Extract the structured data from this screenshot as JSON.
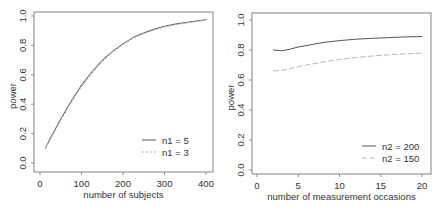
{
  "chart_data": [
    {
      "type": "line",
      "title": "",
      "xlabel": "number of subjects",
      "ylabel": "power",
      "xlim": [
        0,
        400
      ],
      "ylim": [
        0.0,
        1.0
      ],
      "xticks": [
        "0",
        "100",
        "200",
        "300",
        "400"
      ],
      "yticks": [
        "0.0",
        "0.2",
        "0.4",
        "0.6",
        "0.8",
        "1.0"
      ],
      "grid": false,
      "legend_position": "bottom-right",
      "x": [
        13,
        25,
        50,
        75,
        100,
        125,
        150,
        175,
        200,
        225,
        250,
        275,
        300,
        325,
        350,
        375,
        400
      ],
      "series": [
        {
          "name": "n1 = 5",
          "style": "solid",
          "color": "#555555",
          "values": [
            0.1,
            0.17,
            0.3,
            0.42,
            0.53,
            0.62,
            0.7,
            0.76,
            0.81,
            0.855,
            0.885,
            0.91,
            0.93,
            0.945,
            0.955,
            0.965,
            0.975
          ]
        },
        {
          "name": "n1 = 3",
          "style": "dotted",
          "color": "#b0b0b0",
          "values": [
            0.1,
            0.16,
            0.29,
            0.41,
            0.52,
            0.61,
            0.69,
            0.755,
            0.805,
            0.85,
            0.88,
            0.905,
            0.925,
            0.94,
            0.952,
            0.962,
            0.972
          ]
        }
      ]
    },
    {
      "type": "line",
      "title": "",
      "xlabel": "number of measurement occasions",
      "ylabel": "power",
      "xlim": [
        0,
        20
      ],
      "ylim": [
        0.0,
        1.0
      ],
      "xticks": [
        "0",
        "5",
        "10",
        "15",
        "20"
      ],
      "yticks": [
        "0.0",
        "0.2",
        "0.4",
        "0.6",
        "0.8",
        "1.0"
      ],
      "grid": false,
      "legend_position": "bottom-right",
      "x": [
        2,
        3,
        4,
        5,
        6,
        8,
        10,
        12,
        14,
        16,
        18,
        20
      ],
      "series": [
        {
          "name": "n2 = 200",
          "style": "solid",
          "color": "#555555",
          "values": [
            0.8,
            0.795,
            0.805,
            0.82,
            0.83,
            0.85,
            0.863,
            0.872,
            0.878,
            0.883,
            0.887,
            0.89
          ]
        },
        {
          "name": "n2 = 150",
          "style": "dashed",
          "color": "#b8b8b8",
          "values": [
            0.66,
            0.665,
            0.675,
            0.69,
            0.7,
            0.72,
            0.737,
            0.75,
            0.76,
            0.768,
            0.774,
            0.78
          ]
        }
      ]
    }
  ]
}
